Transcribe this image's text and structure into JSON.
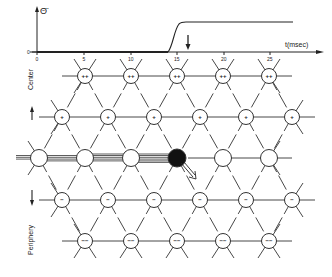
{
  "graph": {
    "y_label": "Θ̈",
    "y_zero_label": "0",
    "x_label": "t(msec)",
    "x_ticks": [
      "0",
      "5",
      "10",
      "15",
      "20",
      "25"
    ],
    "stimulus_marker": "down-arrow",
    "curve": "step rising between ~13.5 and ~15 msec"
  },
  "side_labels": {
    "top": "Center",
    "bottom": "Periphery"
  },
  "grid": {
    "rows": [
      {
        "y": 76,
        "signs": [
          "++",
          "++",
          "++",
          "++",
          "++"
        ],
        "xs": [
          85,
          131,
          177,
          223,
          269
        ]
      },
      {
        "y": 117,
        "signs": [
          "+",
          "+",
          "+",
          "+",
          "+",
          "+"
        ],
        "xs": [
          62,
          108,
          154,
          200,
          246,
          292
        ]
      },
      {
        "y": 158,
        "signs": [
          "",
          "",
          "",
          "●",
          "",
          ""
        ],
        "xs": [
          39,
          85,
          131,
          177,
          223,
          269
        ]
      },
      {
        "y": 200,
        "signs": [
          "−",
          "−",
          "−",
          "−",
          "−",
          "−"
        ],
        "xs": [
          62,
          108,
          154,
          200,
          246,
          292
        ]
      },
      {
        "y": 241,
        "signs": [
          "−−",
          "−−",
          "−−",
          "−−",
          "−−"
        ],
        "xs": [
          85,
          131,
          177,
          223,
          269
        ]
      }
    ],
    "active_node": {
      "row": 2,
      "col": 3
    }
  }
}
